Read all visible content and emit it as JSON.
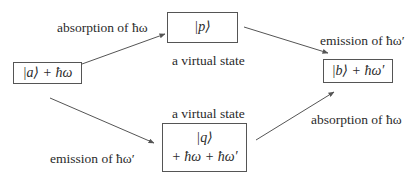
{
  "diagram": {
    "type": "two-photon transition pathways",
    "nodes": {
      "a": {
        "line1": "|a⟩ + ħω"
      },
      "p": {
        "line1": "|p⟩",
        "caption": "a virtual state"
      },
      "q": {
        "line1": "|q⟩",
        "line2": "+ ħω + ħω′",
        "caption": "a virtual state"
      },
      "b": {
        "line1": "|b⟩ + ħω′"
      }
    },
    "edges": [
      {
        "from": "a",
        "to": "p",
        "label": "absorption of ħω"
      },
      {
        "from": "p",
        "to": "b",
        "label": "emission of ħω′"
      },
      {
        "from": "a",
        "to": "q",
        "label": "emission of ħω′"
      },
      {
        "from": "q",
        "to": "b",
        "label": "absorption of ħω"
      }
    ]
  }
}
